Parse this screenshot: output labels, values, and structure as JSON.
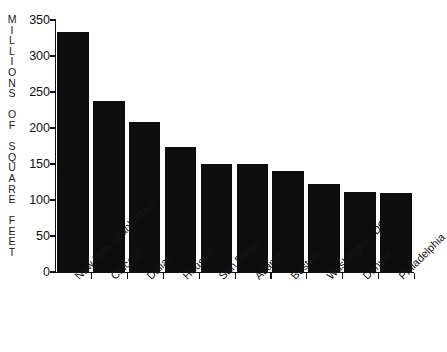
{
  "chart_data": {
    "type": "bar",
    "title": "",
    "xlabel": "",
    "ylabel": "MILLIONS OF SQUARE FEET",
    "ylabel_stacked": "M\nI\nL\nL\nI\nO\nN\nS\n\nO\nF\n\nS\nQ\nU\nA\nR\nE\n\nF\nE\nE\nT",
    "categories": [
      "New York (Manhattan)",
      "Chicago",
      "Dallas",
      "Houston",
      "San Diego",
      "Atlanta",
      "Boston",
      "Washington, DC",
      "Denver",
      "Philadelphia"
    ],
    "values": [
      333,
      238,
      208,
      173,
      150,
      150,
      140,
      122,
      111,
      110
    ],
    "ylim": [
      0,
      350
    ],
    "yticks": [
      0,
      50,
      100,
      150,
      200,
      250,
      300,
      350
    ],
    "ytick_labels": [
      "0",
      "50",
      "100",
      "150",
      "200",
      "250",
      "300",
      "350"
    ],
    "grid": false,
    "legend": false,
    "bar_color": "#0d0d0d",
    "axis_color": "#111111",
    "background_color": "#ffffff"
  }
}
